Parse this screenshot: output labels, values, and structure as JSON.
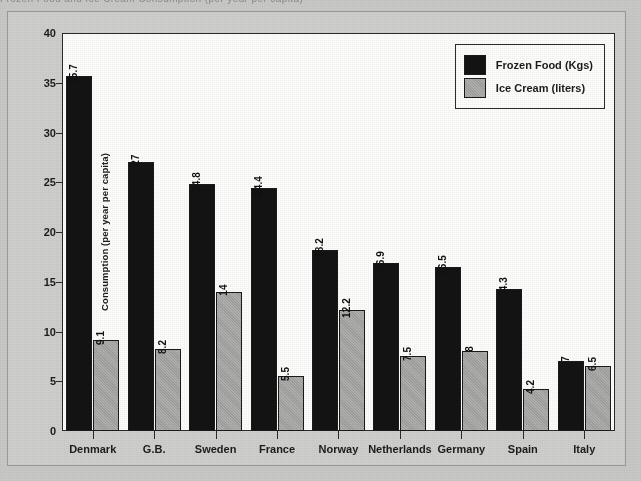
{
  "page": {
    "top_cut_text": "Frozen Food and Ice Cream Consumption (per year per capita)"
  },
  "legend": {
    "position": "top-right-inside",
    "entries": [
      {
        "label": "Frozen Food (Kgs)",
        "color": "#131313",
        "icon": "legend-swatch-icon"
      },
      {
        "label": "Ice Cream (liters)",
        "color": "#a8a8a6",
        "icon": "legend-swatch-icon"
      }
    ]
  },
  "chart_data": {
    "type": "bar",
    "title": "",
    "subtitle": "",
    "xlabel": "",
    "ylabel": "Consumption (per year per capita)",
    "ylim": [
      0,
      40
    ],
    "ytick_step": 5,
    "yticks": [
      0,
      5,
      10,
      15,
      20,
      25,
      30,
      35,
      40
    ],
    "grid": false,
    "legend_position": "upper right",
    "categories": [
      "Denmark",
      "G.B.",
      "Sweden",
      "France",
      "Norway",
      "Netherlands",
      "Germany",
      "Spain",
      "Italy"
    ],
    "series": [
      {
        "name": "Frozen Food (Kgs)",
        "color": "#131313",
        "values": [
          35.7,
          27,
          24.8,
          24.4,
          18.2,
          16.9,
          16.5,
          14.3,
          7
        ],
        "labels": [
          "35.7",
          "27",
          "24.8",
          "24.4",
          "18.2",
          "16.9",
          "16.5",
          "14.3",
          "7"
        ]
      },
      {
        "name": "Ice Cream (liters)",
        "color": "#a8a8a6",
        "values": [
          9.1,
          8.2,
          14,
          5.5,
          12.2,
          7.5,
          8,
          4.2,
          6.5
        ],
        "labels": [
          "9.1",
          "8.2",
          "14",
          "5.5",
          "12.2",
          "7.5",
          "8",
          "4.2",
          "6.5"
        ]
      }
    ]
  }
}
